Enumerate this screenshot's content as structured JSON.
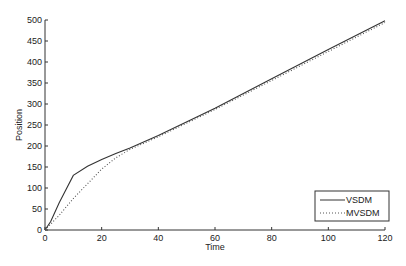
{
  "chart_data": {
    "type": "line",
    "title": "",
    "xlabel": "Time",
    "ylabel": "Position",
    "xlim": [
      0,
      120
    ],
    "ylim": [
      0,
      500
    ],
    "xticks": [
      0,
      20,
      40,
      60,
      80,
      100,
      120
    ],
    "yticks": [
      0,
      50,
      100,
      150,
      200,
      250,
      300,
      350,
      400,
      450,
      500
    ],
    "grid": false,
    "legend_position": "lower right",
    "series": [
      {
        "name": "VSDM",
        "style": "solid",
        "color": "#333333",
        "x": [
          0,
          2,
          5,
          10,
          15,
          20,
          25,
          30,
          40,
          60,
          80,
          100,
          120
        ],
        "y": [
          0,
          20,
          65,
          130,
          152,
          168,
          182,
          195,
          225,
          290,
          360,
          430,
          498
        ]
      },
      {
        "name": "MVSDM",
        "style": "dotted",
        "color": "#555555",
        "x": [
          0,
          5,
          10,
          15,
          20,
          25,
          30,
          40,
          60,
          80,
          100,
          120
        ],
        "y": [
          0,
          35,
          75,
          110,
          145,
          172,
          192,
          222,
          287,
          356,
          425,
          494
        ]
      }
    ]
  },
  "labels": {
    "xlabel": "Time",
    "ylabel": "Position",
    "legend": [
      "VSDM",
      "MVSDM"
    ]
  }
}
